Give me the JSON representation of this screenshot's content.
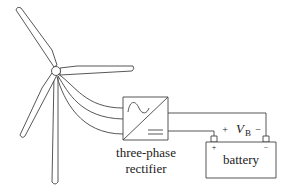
{
  "diagram": {
    "type": "wind-turbine battery charging circuit",
    "components": {
      "turbine": {
        "label": ""
      },
      "rectifier": {
        "label_line1": "three-phase",
        "label_line2": "rectifier"
      },
      "battery": {
        "label": "battery",
        "plus": "+",
        "minus": "−"
      }
    },
    "voltage": {
      "plus": "+",
      "symbol": "V",
      "subscript": "B",
      "minus": "−"
    },
    "colors": {
      "stroke": "#333333",
      "background": "#ffffff"
    }
  }
}
